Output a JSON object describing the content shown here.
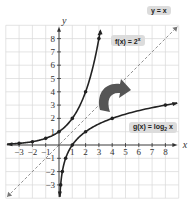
{
  "chart_data": {
    "type": "line",
    "title": "",
    "xlabel": "x",
    "ylabel": "y",
    "xlim": [
      -4,
      9
    ],
    "ylim": [
      -4,
      9
    ],
    "grid": true,
    "x_ticks": [
      -3,
      -2,
      -1,
      1,
      2,
      3,
      4,
      5,
      6,
      7,
      8
    ],
    "y_ticks": [
      -3,
      -2,
      -1,
      1,
      2,
      3,
      4,
      5,
      6,
      7,
      8
    ],
    "series": [
      {
        "name": "f(x) = 2^x",
        "style": "solid",
        "points": [
          [
            -3,
            0.125
          ],
          [
            -2,
            0.25
          ],
          [
            -1,
            0.5
          ],
          [
            0,
            1
          ],
          [
            1,
            2
          ],
          [
            2,
            4
          ],
          [
            3,
            8
          ]
        ]
      },
      {
        "name": "g(x) = log2 x",
        "style": "solid",
        "points": [
          [
            0.125,
            -3
          ],
          [
            0.25,
            -2
          ],
          [
            0.5,
            -1
          ],
          [
            1,
            0
          ],
          [
            2,
            1
          ],
          [
            4,
            2
          ],
          [
            8,
            3
          ]
        ]
      },
      {
        "name": "y = x",
        "style": "dashed",
        "points": [
          [
            -4,
            -4
          ],
          [
            9,
            9
          ]
        ]
      }
    ],
    "annotations": [
      "y = x",
      "f(x) = 2^x",
      "g(x) = log2 x",
      "reflection-arrow"
    ]
  },
  "labels": {
    "yx": "y = x",
    "f": "f(x) = 2",
    "f_exp": "x",
    "g": "g(x) = log",
    "g_sub": "2",
    "g_tail": " x",
    "x_axis": "x",
    "y_axis": "y"
  }
}
